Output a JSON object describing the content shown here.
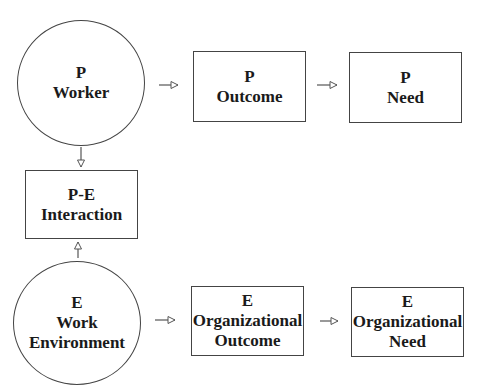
{
  "nodes": {
    "p_worker": {
      "line1": "P",
      "line2": "Worker"
    },
    "p_outcome": {
      "line1": "P",
      "line2": "Outcome"
    },
    "p_need": {
      "line1": "P",
      "line2": "Need"
    },
    "pe_interaction": {
      "line1": "P-E",
      "line2": "Interaction"
    },
    "e_work_environment": {
      "line1": "E",
      "line2": "Work",
      "line3": "Environment"
    },
    "e_org_outcome": {
      "line1": "E",
      "line2": "Organizational",
      "line3": "Outcome"
    },
    "e_org_need": {
      "line1": "E",
      "line2": "Organizational",
      "line3": "Need"
    }
  },
  "edges": [
    {
      "from": "P Worker",
      "to": "P Outcome"
    },
    {
      "from": "P Outcome",
      "to": "P Need"
    },
    {
      "from": "P Worker",
      "to": "P-E Interaction"
    },
    {
      "from": "E Work Environment",
      "to": "P-E Interaction"
    },
    {
      "from": "E Work Environment",
      "to": "E Organizational Outcome"
    },
    {
      "from": "E Organizational Outcome",
      "to": "E Organizational Need"
    }
  ],
  "colors": {
    "stroke": "#444444",
    "text": "#1a1a1a",
    "background": "#ffffff"
  }
}
